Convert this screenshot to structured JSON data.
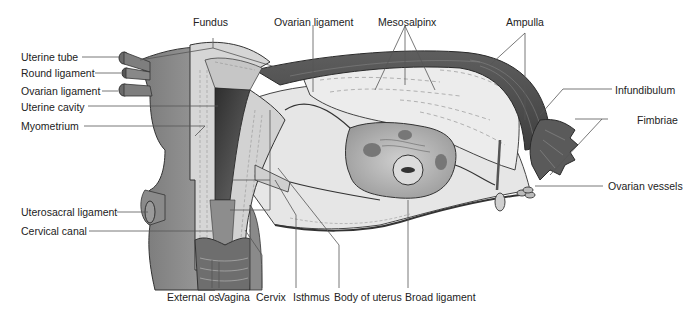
{
  "diagram": {
    "colors": {
      "leader_line": "#555555",
      "tissue_dark": "#5a5a5a",
      "tissue_mid": "#8c8c8c",
      "tissue_light": "#cfcfcf",
      "broad_ligament": "#e4e4e4",
      "cavity": "#3c3c3c",
      "text": "#222222"
    },
    "labels": {
      "fundus": "Fundus",
      "ovarian_ligament_top": "Ovarian ligament",
      "mesosalpinx": "Mesosalpinx",
      "ampulla": "Ampulla",
      "infundibulum": "Infundibulum",
      "fimbriae": "Fimbriae",
      "ovarian_vessels": "Ovarian vessels",
      "uterine_tube": "Uterine tube",
      "round_ligament": "Round ligament",
      "ovarian_ligament_left": "Ovarian ligament",
      "uterine_cavity": "Uterine cavity",
      "myometrium": "Myometrium",
      "uterosacral_ligament": "Uterosacral ligament",
      "cervical_canal": "Cervical canal",
      "external_os": "External os",
      "vagina": "Vagina",
      "cervix": "Cervix",
      "isthmus": "Isthmus",
      "body_of_uterus": "Body of uterus",
      "broad_ligament": "Broad ligament"
    }
  }
}
